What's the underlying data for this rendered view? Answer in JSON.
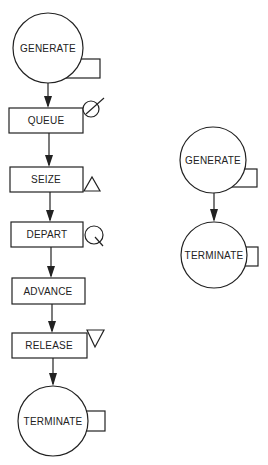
{
  "diagram": {
    "type": "GPSS block diagram",
    "colors": {
      "ink": "#222222",
      "background": "#ffffff"
    },
    "left_flow": {
      "blocks": [
        {
          "id": "gen1",
          "label": "GENERATE",
          "shape": "circle-with-box"
        },
        {
          "id": "queue",
          "label": "QUEUE",
          "shape": "rectangle",
          "symbol": "queue-circle-slash"
        },
        {
          "id": "seize",
          "label": "SEIZE",
          "shape": "rectangle",
          "symbol": "triangle-up"
        },
        {
          "id": "depart",
          "label": "DEPART",
          "shape": "rectangle",
          "symbol": "circle-with-tail"
        },
        {
          "id": "advance",
          "label": "ADVANCE",
          "shape": "rectangle",
          "symbol": "none"
        },
        {
          "id": "release",
          "label": "RELEASE",
          "shape": "rectangle",
          "symbol": "triangle-down"
        },
        {
          "id": "term1",
          "label": "TERMINATE",
          "shape": "circle-with-box"
        }
      ],
      "edges": [
        [
          "gen1",
          "queue"
        ],
        [
          "queue",
          "seize"
        ],
        [
          "seize",
          "depart"
        ],
        [
          "depart",
          "advance"
        ],
        [
          "advance",
          "release"
        ],
        [
          "release",
          "term1"
        ]
      ]
    },
    "right_flow": {
      "blocks": [
        {
          "id": "gen2",
          "label": "GENERATE",
          "shape": "circle-with-box"
        },
        {
          "id": "term2",
          "label": "TERMINATE",
          "shape": "circle-with-box"
        }
      ],
      "edges": [
        [
          "gen2",
          "term2"
        ]
      ]
    }
  }
}
